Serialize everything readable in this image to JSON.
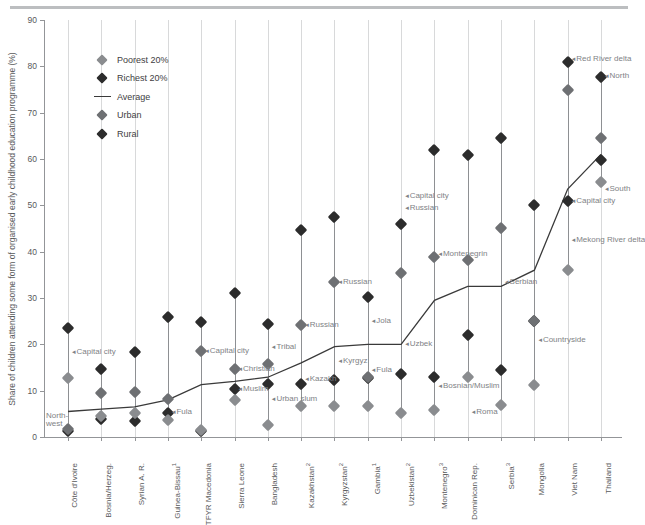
{
  "chart_data": {
    "type": "scatter",
    "title": "",
    "ylabel": "Share of children attending some form of organised early childhood education programme (%)",
    "xlabel": "",
    "ylim": [
      0,
      90
    ],
    "yticks": [
      0,
      10,
      20,
      30,
      40,
      50,
      60,
      70,
      80,
      90
    ],
    "grid": false,
    "legend_position": "upper-left-inside",
    "legend": [
      {
        "key": "poorest",
        "label": "Poorest 20%",
        "marker": "diamond",
        "color": "#8a8c8f"
      },
      {
        "key": "richest",
        "label": "Richest 20%",
        "marker": "diamond",
        "color": "#2c2c2c"
      },
      {
        "key": "average",
        "label": "Average",
        "marker": "line",
        "color": "#3a3a3a"
      },
      {
        "key": "urban",
        "label": "Urban",
        "marker": "diamond",
        "color": "#6e7073"
      },
      {
        "key": "rural",
        "label": "Rural",
        "marker": "diamond",
        "color": "#2c2c2c"
      }
    ],
    "categories": [
      "Côte d'Ivoire",
      "Bosnia/Herzeg.",
      "Syrian A. R.",
      "Guinea-Bissau 1",
      "TFYR Macedonia",
      "Sierra Leone",
      "Bangladesh",
      "Kazakhstan 2",
      "Kyrgyzstan 2",
      "Gambia 1",
      "Uzbekistan 2",
      "Montenegro 3",
      "Dominican Rep.",
      "Serbia 3",
      "Mongolia",
      "Viet Nam",
      "Thailand"
    ],
    "series": [
      {
        "name": "Poorest 20%",
        "values": [
          12.7,
          4.5,
          5.2,
          3.7,
          1.5,
          7.9,
          2.6,
          6.6,
          6.6,
          6.6,
          5.2,
          5.8,
          13.0,
          7.0,
          11.2,
          36.0,
          55.0
        ]
      },
      {
        "name": "Richest 20%",
        "values": [
          23.5,
          14.7,
          18.4,
          25.8,
          24.8,
          31.0,
          24.4,
          44.7,
          47.5,
          30.3,
          45.9,
          62.0,
          60.8,
          64.5,
          50.0,
          81.0,
          77.8
        ]
      },
      {
        "name": "Average",
        "values": [
          5.5,
          6.0,
          6.5,
          8.0,
          11.3,
          12.0,
          12.9,
          16.0,
          19.5,
          20.0,
          20.0,
          29.5,
          32.5,
          32.5,
          36.0,
          53.5,
          61.0
        ]
      },
      {
        "name": "Urban",
        "values": [
          1.7,
          9.6,
          9.8,
          8.3,
          18.6,
          14.6,
          15.8,
          24.2,
          33.5,
          13.0,
          35.3,
          38.8,
          38.3,
          45.2,
          25.0,
          75.0,
          64.5
        ]
      },
      {
        "name": "Rural",
        "values": [
          1.2,
          3.9,
          3.5,
          5.2,
          1.2,
          10.3,
          11.5,
          11.4,
          12.2,
          12.8,
          13.6,
          13.0,
          22.0,
          14.5,
          25.0,
          51.0,
          59.8
        ]
      }
    ],
    "annotations": [
      {
        "text": "Capital city",
        "category": "Côte d'Ivoire",
        "value": 18.3
      },
      {
        "text": "North-west",
        "category": "Côte d'Ivoire",
        "value": 3.6,
        "multiline": true,
        "line1": "North-",
        "line2": "west"
      },
      {
        "text": "Fula",
        "category": "Guinea-Bissau 1",
        "value": 5.5
      },
      {
        "text": "Capital city",
        "category": "TFYR Macedonia",
        "value": 18.6
      },
      {
        "text": "Christian",
        "category": "Sierra Leone",
        "value": 14.6
      },
      {
        "text": "Muslim",
        "category": "Sierra Leone",
        "value": 10.3
      },
      {
        "text": "Tribal",
        "category": "Bangladesh",
        "value": 19.5
      },
      {
        "text": "Urban slum",
        "category": "Bangladesh",
        "value": 8.3
      },
      {
        "text": "Russian",
        "category": "Kazakhstan 2",
        "value": 24.2
      },
      {
        "text": "Kazakh",
        "category": "Kazakhstan 2",
        "value": 12.5
      },
      {
        "text": "Russian",
        "category": "Kyrgyzstan 2",
        "value": 33.5
      },
      {
        "text": "Kyrgyz",
        "category": "Kyrgyzstan 2",
        "value": 16.5
      },
      {
        "text": "Jola",
        "category": "Gambia 1",
        "value": 25.0
      },
      {
        "text": "Fula",
        "category": "Gambia 1",
        "value": 14.5
      },
      {
        "text": "Capital city",
        "category": "Uzbekistan 2",
        "value": 52.0
      },
      {
        "text": "Russian",
        "category": "Uzbekistan 2",
        "value": 49.5
      },
      {
        "text": "Uzbek",
        "category": "Uzbekistan 2",
        "value": 20.0
      },
      {
        "text": "Montenegrin",
        "category": "Montenegro 3",
        "value": 39.5
      },
      {
        "text": "Bosnian/Muslim",
        "category": "Montenegro 3",
        "value": 11.0
      },
      {
        "text": "Roma",
        "category": "Dominican Rep.",
        "value": 5.5
      },
      {
        "text": "Serbian",
        "category": "Serbia 3",
        "value": 33.5
      },
      {
        "text": "Countryside",
        "category": "Mongolia",
        "value": 21.0
      },
      {
        "text": "Capital city",
        "category": "Viet Nam",
        "value": 51.0
      },
      {
        "text": "Mekong River delta",
        "category": "Viet Nam",
        "value": 42.5
      },
      {
        "text": "Red River delta",
        "category": "Viet Nam",
        "value": 81.5
      },
      {
        "text": "North",
        "category": "Thailand",
        "value": 78.0
      },
      {
        "text": "South",
        "category": "Thailand",
        "value": 53.5
      }
    ]
  }
}
